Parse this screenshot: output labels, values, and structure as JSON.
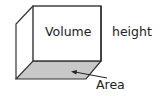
{
  "diagram": {
    "type": "box-volume-illustration",
    "labels": {
      "volume": "Volume",
      "height": "height",
      "area": "Area"
    },
    "colors": {
      "edge": "#333333",
      "base_fill": "#c8c8c8",
      "background": "#ffffff",
      "text": "#222222"
    }
  }
}
